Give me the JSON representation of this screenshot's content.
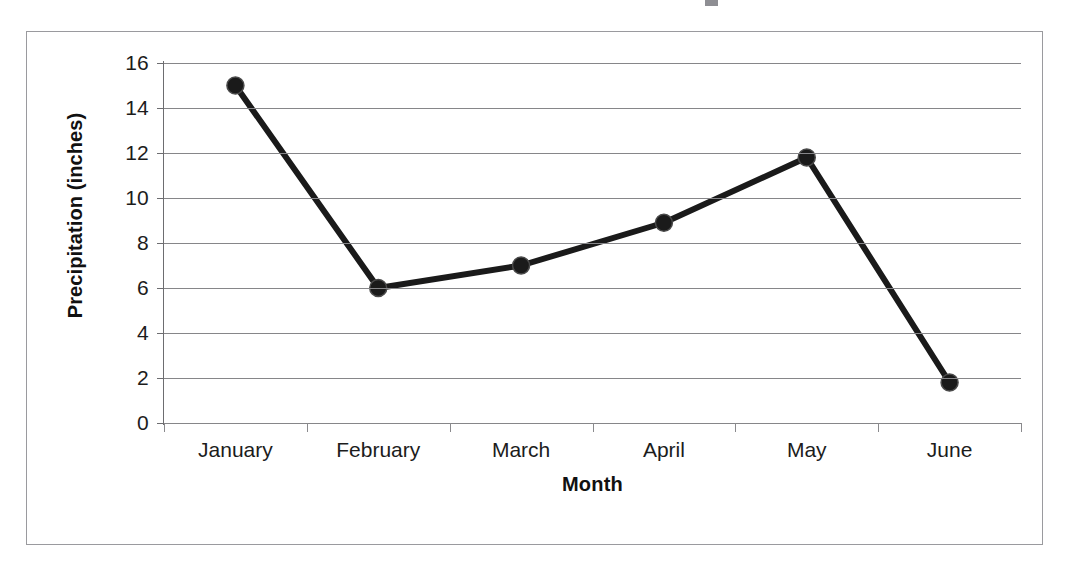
{
  "chart_data": {
    "type": "line",
    "title": "",
    "xlabel": "Month",
    "ylabel": "Precipitation (inches)",
    "categories": [
      "January",
      "February",
      "March",
      "April",
      "May",
      "June"
    ],
    "values": [
      15,
      6,
      7,
      8.9,
      11.8,
      1.8
    ],
    "series": [
      {
        "name": "Precipitation",
        "values": [
          15,
          6,
          7,
          8.9,
          11.8,
          1.8
        ]
      }
    ],
    "ylim": [
      0,
      16
    ],
    "ytick_step": 2,
    "ytick_labels": [
      "16",
      "14",
      "12",
      "10",
      "8",
      "6",
      "4",
      "2",
      "0"
    ],
    "ytick_values": [
      16,
      14,
      12,
      10,
      8,
      6,
      4,
      2,
      0
    ],
    "grid": true,
    "grid_axis": "y",
    "legend": false,
    "legend_position": "none",
    "marker": "circle",
    "marker_color": "#1a1a1a",
    "line_color": "#1a1a1a",
    "line_width": 6,
    "marker_size": 17,
    "plot_background": "#ffffff",
    "grid_color": "#868689",
    "axis_color": "#6d6d70",
    "frame_color": "#9a9a9e"
  },
  "axes": {
    "y_title": "Precipitation (inches)",
    "x_title": "Month"
  },
  "ticks": {
    "y": [
      "16",
      "14",
      "12",
      "10",
      "8",
      "6",
      "4",
      "2",
      "0"
    ],
    "x": [
      "January",
      "February",
      "March",
      "April",
      "May",
      "June"
    ]
  }
}
